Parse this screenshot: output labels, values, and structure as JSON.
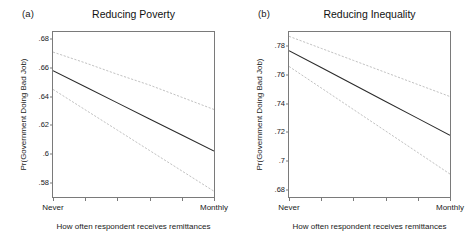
{
  "figure": {
    "background": "#ffffff",
    "line_color_solid": "#2b2b2b",
    "line_color_ci": "#b9b9b9"
  },
  "chart_data": [
    {
      "type": "line",
      "panel_tag": "(a)",
      "title": "Reducing Poverty",
      "xlabel": "How often respondent receives remittances",
      "ylabel": "Pr(Government Doing Bad Job)",
      "x": [
        0,
        1,
        2,
        3,
        4,
        5
      ],
      "xticklabels": [
        "Never",
        "",
        "",
        "",
        "",
        "Monthly"
      ],
      "xlim": [
        0,
        5
      ],
      "ylim": [
        0.57,
        0.685
      ],
      "yticks": [
        0.58,
        0.6,
        0.62,
        0.64,
        0.66,
        0.68
      ],
      "yticklabels": [
        ".58",
        ".6",
        ".62",
        ".64",
        ".66",
        ".68"
      ],
      "grid": false,
      "legend": "none",
      "series": [
        {
          "name": "Upper 95% CI",
          "style": "dashed",
          "color": "#b9b9b9",
          "values": [
            0.671,
            0.6635,
            0.6555,
            0.648,
            0.6395,
            0.631
          ]
        },
        {
          "name": "Predicted probability",
          "style": "solid",
          "color": "#2b2b2b",
          "values": [
            0.658,
            0.6468,
            0.6356,
            0.6244,
            0.6132,
            0.602
          ]
        },
        {
          "name": "Lower 95% CI",
          "style": "dashed",
          "color": "#b9b9b9",
          "values": [
            0.645,
            0.6308,
            0.6166,
            0.6024,
            0.5882,
            0.574
          ]
        }
      ]
    },
    {
      "type": "line",
      "panel_tag": "(b)",
      "title": "Reducing Inequality",
      "xlabel": "How often respondent receives remittances",
      "ylabel": "Pr(Government Doing Bad Job)",
      "x": [
        0,
        1,
        2,
        3,
        4,
        5
      ],
      "xticklabels": [
        "Never",
        "",
        "",
        "",
        "",
        "Monthly"
      ],
      "xlim": [
        0,
        5
      ],
      "ylim": [
        0.675,
        0.79
      ],
      "yticks": [
        0.68,
        0.7,
        0.72,
        0.74,
        0.76,
        0.78
      ],
      "yticklabels": [
        ".68",
        ".7",
        ".72",
        ".74",
        ".76",
        ".78"
      ],
      "grid": false,
      "legend": "none",
      "series": [
        {
          "name": "Upper 95% CI",
          "style": "dashed",
          "color": "#b9b9b9",
          "values": [
            0.787,
            0.7786,
            0.7702,
            0.7618,
            0.7534,
            0.745
          ]
        },
        {
          "name": "Predicted probability",
          "style": "solid",
          "color": "#2b2b2b",
          "values": [
            0.777,
            0.7652,
            0.7534,
            0.7416,
            0.7298,
            0.718
          ]
        },
        {
          "name": "Lower 95% CI",
          "style": "dashed",
          "color": "#b9b9b9",
          "values": [
            0.766,
            0.751,
            0.736,
            0.721,
            0.706,
            0.691
          ]
        }
      ]
    }
  ]
}
